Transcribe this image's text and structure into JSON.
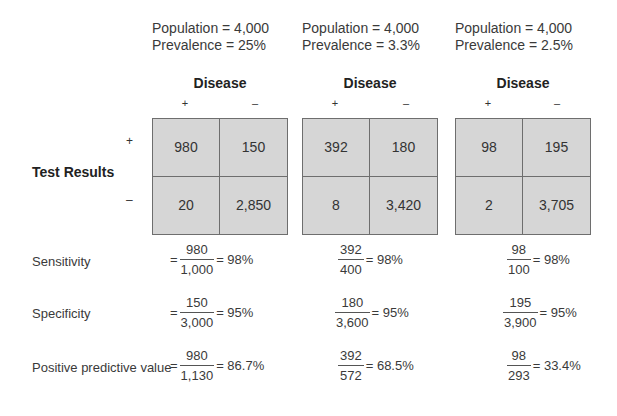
{
  "panels": [
    {
      "population_label": "Population = 4,000",
      "prevalence_label": "Prevalence = 25%",
      "disease_label": "Disease",
      "col_plus": "+",
      "col_minus": "–",
      "cells": {
        "tp": "980",
        "fp": "150",
        "fn": "20",
        "tn": "2,850"
      },
      "sensitivity": {
        "prefix": "=",
        "num": "980",
        "den": "1,000",
        "result": "= 98%"
      },
      "specificity": {
        "prefix": "=",
        "num": "150",
        "den": "3,000",
        "result": "= 95%"
      },
      "ppv": {
        "prefix": "=",
        "num": "980",
        "den": "1,130",
        "result": "= 86.7%"
      }
    },
    {
      "population_label": "Population = 4,000",
      "prevalence_label": "Prevalence = 3.3%",
      "disease_label": "Disease",
      "col_plus": "+",
      "col_minus": "–",
      "cells": {
        "tp": "392",
        "fp": "180",
        "fn": "8",
        "tn": "3,420"
      },
      "sensitivity": {
        "num": "392",
        "den": "400",
        "result": "= 98%"
      },
      "specificity": {
        "num": "180",
        "den": "3,600",
        "result": "= 95%"
      },
      "ppv": {
        "num": "392",
        "den": "572",
        "result": "= 68.5%"
      }
    },
    {
      "population_label": "Population = 4,000",
      "prevalence_label": "Prevalence = 2.5%",
      "disease_label": "Disease",
      "col_plus": "+",
      "col_minus": "–",
      "cells": {
        "tp": "98",
        "fp": "195",
        "fn": "2",
        "tn": "3,705"
      },
      "sensitivity": {
        "num": "98",
        "den": "100",
        "result": "= 98%"
      },
      "specificity": {
        "num": "195",
        "den": "3,900",
        "result": "= 95%"
      },
      "ppv": {
        "num": "98",
        "den": "293",
        "result": "= 33.4%"
      }
    }
  ],
  "row_header": {
    "label": "Test Results",
    "plus": "+",
    "minus": "–"
  },
  "metrics": {
    "sensitivity": "Sensitivity",
    "specificity": "Specificity",
    "ppv": "Positive predictive value"
  },
  "colors": {
    "cell_fill": "#d6d6d6",
    "border": "#6e6e6e",
    "text": "#3a3a3a"
  }
}
